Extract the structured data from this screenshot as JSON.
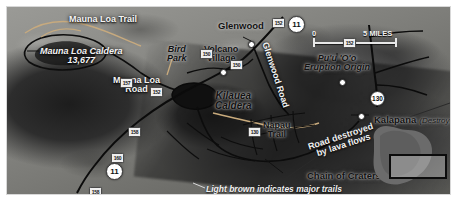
{
  "map": {
    "title": "Hawaii Volcanoes National Park Area Map",
    "labels": {
      "mauna_loa_trail": "Mauna Loa Trail",
      "mauna_loa_caldera": "Mauna Loa Caldera",
      "mauna_loa_caldera_elevation": "13,677",
      "mauna_loa_road": "Mauna Loa\nRoad",
      "mauna_loa_road_line1": "Mauna Loa",
      "mauna_loa_road_line2": "Road",
      "bird_park_line1": "Bird",
      "bird_park_line2": "Park",
      "volcano_village_line1": "Volcano",
      "volcano_village_line2": "Village",
      "glenwood": "Glenwood",
      "glenwood_road": "Glenwood Road",
      "kilauea_caldera_line1": "Kilauea",
      "kilauea_caldera_line2": "Caldera",
      "puuoo_line1": "Pu'u 'O'o",
      "puuoo_line2": "Eruption Origin",
      "napau_trail_line1": "Napau",
      "napau_trail_line2": "Trail",
      "kalapana": "Kalapana",
      "kalapana_status": "(Destroyed)",
      "chain_of_craters_road": "Chain of Craters Road",
      "road_destroyed_line1": "Road destroyed",
      "road_destroyed_line2": "by lava flows",
      "legend_trails": "Light brown indicates major trails"
    },
    "scale": {
      "min": "0",
      "max": "5 MILES"
    },
    "highway_shields": [
      {
        "id": "shield-11-north",
        "label": "11"
      },
      {
        "id": "shield-130",
        "label": "130"
      },
      {
        "id": "shield-11-south",
        "label": "11"
      }
    ],
    "secondary_route_markers": [
      {
        "id": "shield-r1",
        "label": "152"
      },
      {
        "id": "shield-r2",
        "label": "130"
      },
      {
        "id": "shield-r3",
        "label": "150"
      },
      {
        "id": "shield-r4",
        "label": "150"
      },
      {
        "id": "shield-r5",
        "label": "157"
      },
      {
        "id": "shield-r6",
        "label": "152"
      },
      {
        "id": "shield-r7",
        "label": "158"
      },
      {
        "id": "shield-r8",
        "label": "160"
      },
      {
        "id": "shield-r9",
        "label": "158"
      },
      {
        "id": "shield-r10",
        "label": "152"
      }
    ],
    "colors": {
      "terrain_light": "#9a9a96",
      "terrain_dark": "#2d2d2d",
      "lava_flow": "#1c1c1c",
      "road": "#101010",
      "trail_light_brown": "#c9ab7d",
      "label_dark": "#121212",
      "label_light": "#f4f4f4",
      "shield_fill": "#ffffff",
      "inset_island": "#6f6f6f",
      "inset_box_border": "#0c0c0c"
    },
    "inset": {
      "name": "island-of-hawaii-locator"
    }
  }
}
